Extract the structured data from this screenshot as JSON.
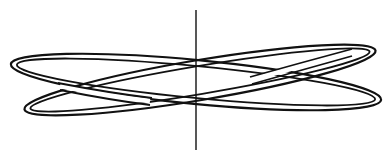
{
  "figure": {
    "description": "Line drawing of two interlinked tilted rings around a vertical axis",
    "background": "#ffffff",
    "ink_color": "#111111",
    "axis": {
      "x": 196,
      "y_top": 10,
      "y_bottom": 150
    },
    "rings": [
      {
        "name": "ring-a",
        "cx": 196,
        "cy": 82,
        "rx": 186,
        "ry": 22,
        "rotation_deg": 5.5,
        "band_width": 7
      },
      {
        "name": "ring-b",
        "cx": 200,
        "cy": 80,
        "rx": 178,
        "ry": 20,
        "rotation_deg": -9.5,
        "band_width": 7
      }
    ]
  }
}
